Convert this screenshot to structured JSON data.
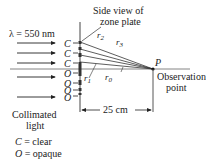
{
  "diagram": {
    "wavelength_label": "λ = 550 nm",
    "zone_plate_label_line1": "Side view of",
    "zone_plate_label_line2": "zone plate",
    "zone_labels": [
      "C",
      "C",
      "C",
      "O",
      "O",
      "O",
      "O"
    ],
    "ray_labels": {
      "r0": "r",
      "r0_sub": "0",
      "r1": "r",
      "r1_sub": "1",
      "r2": "r",
      "r2_sub": "2",
      "r3": "r",
      "r3_sub": "3"
    },
    "point_label": "P",
    "observation_line1": "Observation",
    "observation_line2": "point",
    "distance_label": "25 cm",
    "source_line1": "Collimated",
    "source_line2": "light",
    "legend": [
      {
        "symbol": "C",
        "text": " = clear"
      },
      {
        "symbol": "O",
        "text": " = opaque"
      }
    ]
  }
}
